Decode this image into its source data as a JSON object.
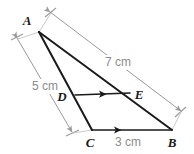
{
  "figure": {
    "type": "geometry-diagram",
    "background_color": "#ffffff",
    "shape_color": "#1a1a1a",
    "dimension_color": "#9a9a9a",
    "label_color": "#1a1a1a",
    "dimension_label_color": "#8c8c8c",
    "vertices": [
      {
        "name": "A",
        "label": "A",
        "x": 39,
        "y": 32,
        "label_x": 27,
        "label_y": 25
      },
      {
        "name": "B",
        "label": "B",
        "x": 172,
        "y": 130,
        "label_x": 172,
        "label_y": 147
      },
      {
        "name": "C",
        "label": "C",
        "x": 92,
        "y": 130,
        "label_x": 90,
        "label_y": 147
      },
      {
        "name": "D",
        "label": "D",
        "x": 75,
        "y": 96,
        "label_x": 62,
        "label_y": 101
      },
      {
        "name": "E",
        "label": "E",
        "x": 130,
        "y": 93,
        "label_x": 134,
        "label_y": 99
      }
    ],
    "segments": [
      {
        "name": "side-AB",
        "from": "A",
        "to": "B"
      },
      {
        "name": "side-AC-extended-to-C",
        "from": "A",
        "to": "C"
      },
      {
        "name": "side-CB",
        "from": "C",
        "to": "B",
        "tick": "single-arrow"
      },
      {
        "name": "segment-DE",
        "from": "D",
        "to": "E",
        "tick": "single-arrow"
      }
    ],
    "dimensions": [
      {
        "name": "dimension-AB",
        "value": "7 cm",
        "measures": "AB",
        "label_x": 118,
        "label_y": 66
      },
      {
        "name": "dimension-AC",
        "value": "5 cm",
        "measures": "AC",
        "label_x": 45,
        "label_y": 90
      },
      {
        "name": "dimension-CB",
        "value": "3 cm",
        "measures": "CB",
        "label_x": 128,
        "label_y": 146
      }
    ]
  }
}
